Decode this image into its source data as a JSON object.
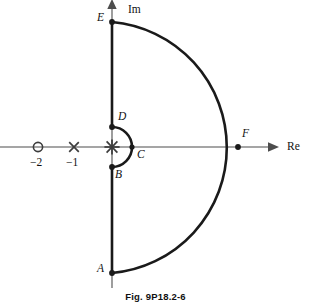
{
  "figure": {
    "caption": "Fig. 9P18.2-6",
    "background_color": "#ffffff",
    "contour_color": "#1a1a1a",
    "axis_color": "#4d4d4d",
    "marker_color": "#3d3d3d"
  },
  "axes": {
    "real_label": "Re",
    "imag_label": "Im",
    "origin": {
      "x": 112,
      "y": 147
    },
    "real_axis": {
      "x_start": 0,
      "x_end": 272,
      "y": 147,
      "arrow": "right"
    },
    "imag_axis": {
      "x": 112,
      "y_start": 288,
      "y_end": 5,
      "arrow": "up"
    }
  },
  "ticks": [
    {
      "name": "tick-minus-two",
      "label": "−2",
      "x": 38,
      "y": 163
    },
    {
      "name": "tick-minus-one",
      "label": "−1",
      "x": 74,
      "y": 163
    }
  ],
  "markers": [
    {
      "name": "zero-marker-minus-two",
      "type": "zero",
      "symbol": "circle",
      "x": 38,
      "y": 147,
      "radius": 4.6,
      "value": -2
    },
    {
      "name": "pole-marker-minus-one",
      "type": "pole",
      "symbol": "cross",
      "x": 74,
      "y": 147,
      "size": 5.2,
      "value": -1,
      "multiplicity": 1
    },
    {
      "name": "pole-marker-origin",
      "type": "pole",
      "symbol": "double-cross",
      "x": 112,
      "y": 147,
      "size": 5.6,
      "value": 0,
      "multiplicity": 2
    }
  ],
  "contour": {
    "name": "nyquist-contour",
    "small_arc_radius": 20,
    "large_arc_radius": 126,
    "points": [
      {
        "label": "A",
        "x": 112,
        "y": 273,
        "label_x": 99,
        "label_y": 268
      },
      {
        "label": "B",
        "x": 112,
        "y": 167,
        "label_x": 115,
        "label_y": 172
      },
      {
        "label": "C",
        "x": 132,
        "y": 147,
        "label_x": 137,
        "label_y": 150
      },
      {
        "label": "D",
        "x": 112,
        "y": 127,
        "label_x": 118,
        "label_y": 114
      },
      {
        "label": "E",
        "x": 112,
        "y": 22,
        "label_x": 98,
        "label_y": 14
      },
      {
        "label": "F",
        "x": 238,
        "y": 147,
        "label_x": 242,
        "label_y": 131
      }
    ]
  }
}
